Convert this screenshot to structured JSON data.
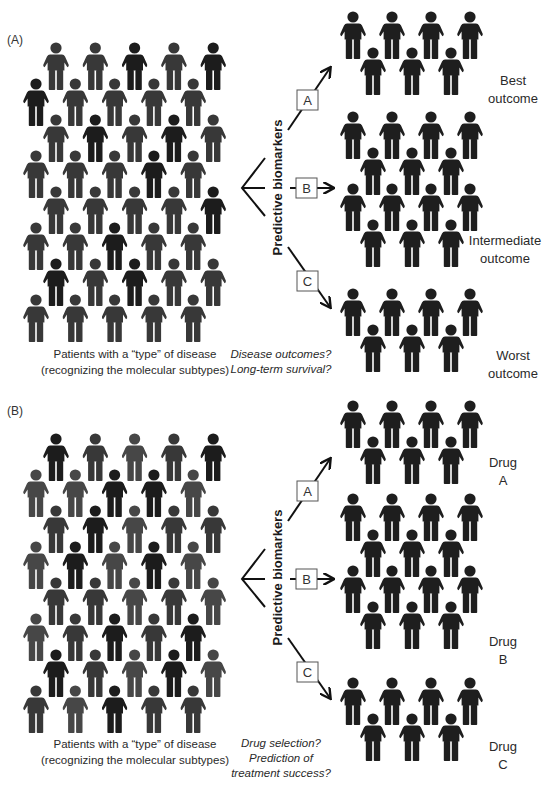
{
  "panels": [
    {
      "label": "(A)",
      "population_caption": [
        "Patients with a “type” of disease",
        "(recognizing the molecular subtypes)"
      ],
      "question": [
        "Disease outcomes?",
        "Long-term survival?"
      ],
      "branch_title": "Predictive biomarkers",
      "branches": [
        {
          "marker": "A",
          "outcome": [
            "Best",
            "outcome"
          ],
          "group_size": 7
        },
        {
          "marker": "B",
          "outcome": [
            "Intermediate",
            "outcome"
          ],
          "group_size": 14
        },
        {
          "marker": "C",
          "outcome": [
            "Worst",
            "outcome"
          ],
          "group_size": 7
        }
      ],
      "population_rows": 8,
      "population_per_row": 5,
      "population_shades": [
        [
          1,
          1,
          2,
          1,
          2
        ],
        [
          2,
          1,
          1,
          1,
          1
        ],
        [
          1,
          2,
          1,
          2,
          1
        ],
        [
          1,
          1,
          1,
          2,
          1
        ],
        [
          1,
          1,
          1,
          1,
          2
        ],
        [
          1,
          1,
          2,
          1,
          1
        ],
        [
          2,
          1,
          2,
          1,
          1
        ],
        [
          1,
          1,
          1,
          1,
          1
        ]
      ]
    },
    {
      "label": "(B)",
      "population_caption": [
        "Patients with a “type” of disease",
        "(recognizing the molecular subtypes)"
      ],
      "question": [
        "Drug selection?",
        "Prediction of",
        "treatment success?"
      ],
      "branch_title": "Predictive biomarkers",
      "branches": [
        {
          "marker": "A",
          "outcome": [
            "Drug",
            "A"
          ],
          "group_size": 7
        },
        {
          "marker": "B",
          "outcome": [
            "Drug",
            "B"
          ],
          "group_size": 14
        },
        {
          "marker": "C",
          "outcome": [
            "Drug",
            "C"
          ],
          "group_size": 7
        }
      ],
      "population_rows": 8,
      "population_per_row": 5,
      "population_shades": [
        [
          2,
          1,
          0,
          1,
          2
        ],
        [
          0,
          0,
          2,
          2,
          0
        ],
        [
          1,
          2,
          0,
          1,
          1
        ],
        [
          0,
          2,
          0,
          2,
          0
        ],
        [
          1,
          1,
          0,
          1,
          0
        ],
        [
          0,
          1,
          2,
          1,
          2
        ],
        [
          2,
          1,
          0,
          2,
          0
        ],
        [
          1,
          0,
          2,
          1,
          1
        ]
      ]
    }
  ],
  "colors": {
    "shade_light": "#474747",
    "shade_medium": "#383838",
    "shade_dark": "#1c1c1c",
    "outcome_figure": "#1e1e1e",
    "arrow": "#111111",
    "box_border": "#555555"
  }
}
